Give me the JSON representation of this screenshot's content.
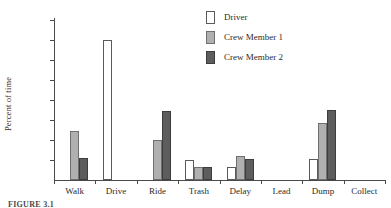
{
  "figure": {
    "caption": "FIGURE 3.1"
  },
  "chart_data": {
    "type": "bar",
    "title": "",
    "xlabel": "",
    "ylabel": "Percent of time",
    "ylim": [
      0,
      80
    ],
    "yticks": [
      10,
      20,
      30,
      40,
      50,
      60,
      70,
      80
    ],
    "ytick_labels": [
      "10",
      "20",
      "30",
      "40",
      "50",
      "60",
      "70",
      "80"
    ],
    "grid": false,
    "legend_position": "top-right",
    "categories": [
      "Walk",
      "Drive",
      "Ride",
      "Trash",
      "Delay",
      "Lead",
      "Dump",
      "Collect"
    ],
    "series": [
      {
        "name": "Driver",
        "color": "#ffffff",
        "values": [
          0,
          70,
          0,
          10,
          6.5,
          0,
          10.5,
          0
        ]
      },
      {
        "name": "Crew Member 1",
        "color": "#b0b0b0",
        "values": [
          24.5,
          0,
          20,
          6.5,
          12,
          0,
          28.5,
          0
        ]
      },
      {
        "name": "Crew Member 2",
        "color": "#5d5d5d",
        "values": [
          11,
          0,
          34.5,
          6.5,
          10.5,
          0,
          35,
          0
        ]
      }
    ]
  }
}
